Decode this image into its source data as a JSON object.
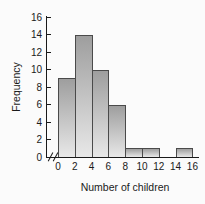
{
  "chart_data": {
    "type": "bar",
    "subtype": "histogram",
    "title": "",
    "xlabel": "Number of children",
    "ylabel": "Frequency",
    "x_ticks": [
      0,
      2,
      4,
      6,
      8,
      10,
      12,
      14,
      16
    ],
    "y_ticks": [
      0,
      2,
      4,
      6,
      8,
      10,
      12,
      14,
      16
    ],
    "xlim": [
      0,
      16
    ],
    "ylim": [
      0,
      16
    ],
    "grid": false,
    "legend": false,
    "x_axis_break_before_zero": true,
    "bin_width": 2,
    "bins": [
      {
        "x_start": 0,
        "x_end": 2,
        "frequency": 9
      },
      {
        "x_start": 2,
        "x_end": 4,
        "frequency": 14
      },
      {
        "x_start": 4,
        "x_end": 6,
        "frequency": 10
      },
      {
        "x_start": 6,
        "x_end": 8,
        "frequency": 6
      },
      {
        "x_start": 8,
        "x_end": 10,
        "frequency": 1
      },
      {
        "x_start": 10,
        "x_end": 12,
        "frequency": 1
      },
      {
        "x_start": 12,
        "x_end": 14,
        "frequency": 0
      },
      {
        "x_start": 14,
        "x_end": 16,
        "frequency": 1
      }
    ],
    "colors": {
      "bar_gradient_top": "#9e9e9e",
      "bar_gradient_bottom": "#e8e8e8",
      "bar_border": "#4a4a4a",
      "axis": "#1a1a1a",
      "text": "#1a1a1a",
      "background": "#fbfbfb"
    }
  }
}
